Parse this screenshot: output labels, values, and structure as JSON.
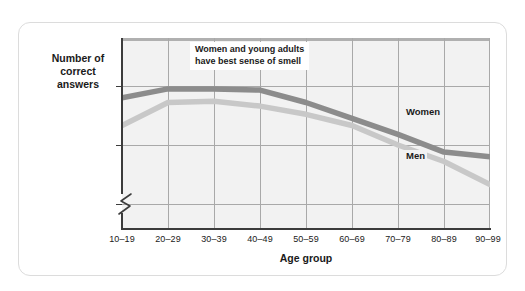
{
  "chart_data": {
    "type": "line",
    "title": "",
    "xlabel": "Age group",
    "ylabel": "Number of correct answers",
    "categories": [
      "10–19",
      "20–29",
      "30–39",
      "40–49",
      "50–59",
      "60–69",
      "70–79",
      "80–89",
      "90–99"
    ],
    "series": [
      {
        "name": "Women",
        "color": "#8c8c8c",
        "values": [
          3.8,
          3.95,
          3.95,
          3.93,
          3.72,
          3.45,
          3.18,
          2.88,
          2.8
        ]
      },
      {
        "name": "Men",
        "color": "#c8c8c8",
        "values": [
          3.33,
          3.72,
          3.74,
          3.66,
          3.52,
          3.33,
          3.0,
          2.72,
          2.33
        ]
      }
    ],
    "ylim": [
      2,
      4.78
    ],
    "yticks": [
      "0",
      "2",
      "3",
      "4"
    ],
    "ytick_values": [
      0,
      2,
      3,
      4
    ],
    "axis_break": true,
    "grid": true,
    "legend_position": "inline-labels",
    "annotations": [
      {
        "text": "Women and young adults\nhave best sense of smell"
      }
    ]
  },
  "axis": {
    "y_title": "Number of\ncorrect answers",
    "x_title": "Age group"
  },
  "colors": {
    "women_line": "#8c8c8c",
    "men_line": "#c8c8c8",
    "gridline": "#a9a9a9",
    "plot_background": "#f2f2f2",
    "card_border": "#dcdcdc",
    "axis": "#3c3c3c"
  }
}
